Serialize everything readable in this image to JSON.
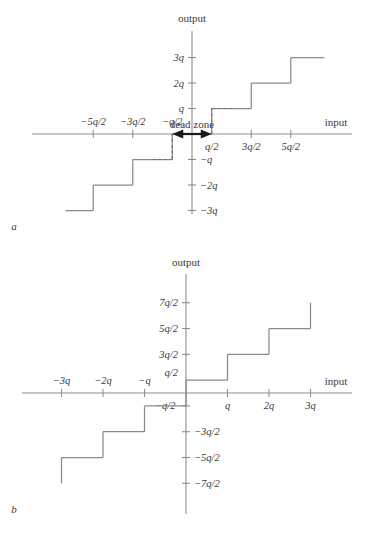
{
  "figure": {
    "panels": [
      {
        "letter": "a",
        "axis_labels": {
          "x": "input",
          "y": "output"
        },
        "annotation": "dead zone",
        "x_ticks": [
          {
            "label": "−5q/2",
            "v": -2.5,
            "side": "above"
          },
          {
            "label": "−3q/2",
            "v": -1.5,
            "side": "above"
          },
          {
            "label": "−q/2",
            "v": -0.5,
            "side": "above"
          },
          {
            "label": "q/2",
            "v": 0.5,
            "side": "below"
          },
          {
            "label": "3q/2",
            "v": 1.5,
            "side": "below"
          },
          {
            "label": "5q/2",
            "v": 2.5,
            "side": "below"
          }
        ],
        "y_ticks": [
          {
            "label": "3q",
            "v": 3
          },
          {
            "label": "2q",
            "v": 2
          },
          {
            "label": "q",
            "v": 1
          },
          {
            "label": "−q",
            "v": -1
          },
          {
            "label": "−2q",
            "v": -2
          },
          {
            "label": "−3q",
            "v": -3
          }
        ]
      },
      {
        "letter": "b",
        "axis_labels": {
          "x": "input",
          "y": "output"
        },
        "annotation": "",
        "x_ticks": [
          {
            "label": "−3q",
            "v": -3,
            "side": "above"
          },
          {
            "label": "−2q",
            "v": -2,
            "side": "above"
          },
          {
            "label": "−q",
            "v": -1,
            "side": "above"
          },
          {
            "label": "−q/2",
            "v": -0.5,
            "side": "below"
          },
          {
            "label": "q",
            "v": 1,
            "side": "below"
          },
          {
            "label": "2q",
            "v": 2,
            "side": "below"
          },
          {
            "label": "3q",
            "v": 3,
            "side": "below"
          }
        ],
        "y_ticks": [
          {
            "label": "7q/2",
            "v": 3.5
          },
          {
            "label": "5q/2",
            "v": 2.5
          },
          {
            "label": "3q/2",
            "v": 1.5
          },
          {
            "label": "q/2",
            "v": 0.5
          },
          {
            "label": "−q/2",
            "v": -0.5
          },
          {
            "label": "−3q/2",
            "v": -1.5
          },
          {
            "label": "−5q/2",
            "v": -2.5
          },
          {
            "label": "−7q/2",
            "v": -3.5
          }
        ]
      }
    ]
  },
  "chart_data": [
    {
      "type": "line",
      "id": "midtread-quantizer-with-dead-zone",
      "title": "",
      "xlabel": "input",
      "ylabel": "output",
      "subplot_label": "a",
      "annotations": [
        {
          "text": "dead zone",
          "x_from": -0.5,
          "x_to": 0.5,
          "y": 0,
          "style": "double-headed-arrow"
        }
      ],
      "xlim": [
        -3.2,
        3.35
      ],
      "ylim": [
        -3.6,
        3.6
      ],
      "xtick_values": [
        -2.5,
        -1.5,
        -0.5,
        0.5,
        1.5,
        2.5
      ],
      "xtick_labels": [
        "−5q/2",
        "−3q/2",
        "−q/2",
        "q/2",
        "3q/2",
        "5q/2"
      ],
      "ytick_values": [
        -3,
        -2,
        -1,
        1,
        2,
        3
      ],
      "ytick_labels": [
        "−3q",
        "−2q",
        "−q",
        "q",
        "2q",
        "3q"
      ],
      "grid": false,
      "legend": "none",
      "staircase_solid": [
        {
          "x_from": -3.2,
          "x_to": -2.5,
          "y": -3
        },
        {
          "x_from": -2.5,
          "x_to": -1.5,
          "y": -2
        },
        {
          "x_from": -1.5,
          "x_to": -0.5,
          "y": -1
        },
        {
          "x_from": -0.5,
          "x_to": 0.5,
          "y": 0
        },
        {
          "x_from": 0.5,
          "x_to": 1.5,
          "y": 1
        },
        {
          "x_from": 1.5,
          "x_to": 2.5,
          "y": 2
        },
        {
          "x_from": 2.5,
          "x_to": 3.35,
          "y": 3
        }
      ],
      "staircase_dashed": [
        {
          "x_from": -1.0,
          "x_to": -0.5,
          "y": -1,
          "riser_x": -0.5,
          "riser_from": -1,
          "riser_to": 0
        },
        {
          "x_from": 0.5,
          "x_to": 1.0,
          "y": 1,
          "riser_x": 0.5,
          "riser_from": 0,
          "riser_to": 1
        }
      ]
    },
    {
      "type": "line",
      "id": "midrise-quantizer",
      "title": "",
      "xlabel": "input",
      "ylabel": "output",
      "subplot_label": "b",
      "annotations": [],
      "xlim": [
        -3.5,
        3.3
      ],
      "ylim": [
        -4.1,
        4.1
      ],
      "xtick_values": [
        -3,
        -2,
        -1,
        -0.5,
        1,
        2,
        3
      ],
      "xtick_labels": [
        "−3q",
        "−2q",
        "−q",
        "−q/2",
        "q",
        "2q",
        "3q"
      ],
      "ytick_values": [
        -3.5,
        -2.5,
        -1.5,
        -0.5,
        0.5,
        1.5,
        2.5,
        3.5
      ],
      "ytick_labels": [
        "−7q/2",
        "−5q/2",
        "−3q/2",
        "−q/2",
        "q/2",
        "3q/2",
        "5q/2",
        "7q/2"
      ],
      "grid": false,
      "legend": "none",
      "staircase_solid": [
        {
          "x_from": -3.0,
          "x_to": -2.0,
          "y": -2.5
        },
        {
          "x_from": -2.0,
          "x_to": -1.0,
          "y": -1.5
        },
        {
          "x_from": -1.0,
          "x_to": 0.0,
          "y": -0.5
        },
        {
          "x_from": 0.0,
          "x_to": 1.0,
          "y": 0.5
        },
        {
          "x_from": 1.0,
          "x_to": 2.0,
          "y": 1.5
        },
        {
          "x_from": 2.0,
          "x_to": 3.0,
          "y": 2.5
        }
      ],
      "staircase_dashed": [],
      "open_risers": [
        {
          "x": -3.0,
          "from": -2.5,
          "to": -3.5
        },
        {
          "x": 3.0,
          "from": 2.5,
          "to": 3.5
        }
      ]
    }
  ]
}
